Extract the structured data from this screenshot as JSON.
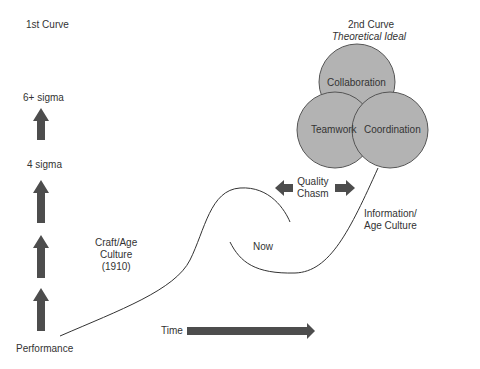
{
  "first_curve": {
    "title": "1st Curve",
    "levels": [
      "6+ sigma",
      "4 sigma"
    ],
    "axis_label": "Performance"
  },
  "second_curve": {
    "title": "2nd Curve",
    "subtitle": "Theoretical Ideal",
    "circles": [
      "Collaboration",
      "Teamwork",
      "Coordination"
    ]
  },
  "annotations": {
    "craft_age": [
      "Craft/Age",
      "Culture",
      "(1910)"
    ],
    "now": "Now",
    "quality_chasm": [
      "Quality",
      "Chasm"
    ],
    "information_age": [
      "Information/",
      "Age Culture"
    ],
    "time": "Time"
  },
  "colors": {
    "arrow": "#4d4d4d",
    "circle_fill": "#b3b3b3",
    "circle_stroke": "#555555",
    "line": "#333333"
  }
}
